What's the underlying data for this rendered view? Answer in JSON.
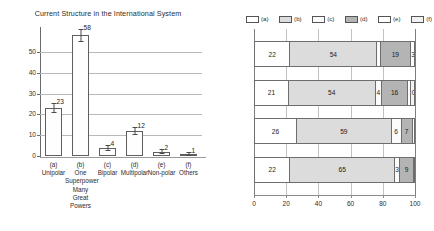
{
  "chart_data": [
    {
      "type": "bar",
      "title": "Current Structure in the International System",
      "xlabel": "",
      "ylabel": "",
      "ylim": [
        0,
        58
      ],
      "yticks": [
        0,
        10,
        20,
        30,
        40,
        50
      ],
      "grid": true,
      "categories": [
        "(a)",
        "(b)",
        "(c)",
        "(d)",
        "(e)",
        "(f)"
      ],
      "category_names": [
        "Unipolar",
        "One Superpower Many Great Powers",
        "Bipolar",
        "Multipolar",
        "Non-polar",
        "Others"
      ],
      "values": [
        23,
        58,
        4,
        12,
        2,
        1
      ],
      "value_labels": [
        "23",
        "58",
        "4",
        "12",
        "2",
        "1"
      ],
      "error_bars": [
        2.5,
        3.0,
        1.5,
        2.0,
        1.2,
        1.0
      ]
    },
    {
      "type": "bar",
      "orientation": "horizontal",
      "stacked": true,
      "title": "",
      "xlabel": "",
      "ylabel": "",
      "xlim": [
        0,
        100
      ],
      "xticks": [
        0,
        20,
        40,
        60,
        80,
        100
      ],
      "xtick_labels": [
        "0",
        "20",
        "40",
        "60",
        "80",
        "100"
      ],
      "categories": [
        "2014",
        "2015",
        "2016",
        "2017"
      ],
      "legend": [
        "(a)",
        "(b)",
        "(c)",
        "(d)",
        "(e)",
        "(f)"
      ],
      "legend_position": "top",
      "series": [
        {
          "name": "(a)",
          "values": [
            22,
            21,
            26,
            22
          ]
        },
        {
          "name": "(b)",
          "values": [
            54,
            54,
            59,
            65
          ]
        },
        {
          "name": "(c)",
          "values": [
            2,
            4,
            6,
            3
          ]
        },
        {
          "name": "(d)",
          "values": [
            19,
            16,
            7,
            9
          ]
        },
        {
          "name": "(e)",
          "values": [
            3,
            2,
            2,
            2
          ]
        },
        {
          "name": "(f)",
          "values": [
            0,
            3,
            0,
            0
          ]
        }
      ],
      "rows": [
        {
          "year": "2014",
          "segments": [
            {
              "key": "(a)",
              "value": 22,
              "label": "22"
            },
            {
              "key": "(b)",
              "value": 54,
              "label": "54"
            },
            {
              "key": "(c)",
              "value": 2,
              "label": "2"
            },
            {
              "key": "(d)",
              "value": 19,
              "label": "19"
            },
            {
              "key": "(e)",
              "value": 3,
              "label": "3"
            },
            {
              "key": "(f)",
              "value": 0,
              "label": ""
            }
          ]
        },
        {
          "year": "2015",
          "segments": [
            {
              "key": "(a)",
              "value": 21,
              "label": "21"
            },
            {
              "key": "(b)",
              "value": 54,
              "label": "54"
            },
            {
              "key": "(c)",
              "value": 4,
              "label": "4"
            },
            {
              "key": "(d)",
              "value": 16,
              "label": "16"
            },
            {
              "key": "(e)",
              "value": 2,
              "label": "2"
            },
            {
              "key": "(f)",
              "value": 3,
              "label": "0"
            }
          ]
        },
        {
          "year": "2016",
          "segments": [
            {
              "key": "(a)",
              "value": 26,
              "label": "26"
            },
            {
              "key": "(b)",
              "value": 59,
              "label": "59"
            },
            {
              "key": "(c)",
              "value": 6,
              "label": "6"
            },
            {
              "key": "(d)",
              "value": 7,
              "label": "7"
            },
            {
              "key": "(e)",
              "value": 2,
              "label": "2"
            },
            {
              "key": "(f)",
              "value": 0,
              "label": ""
            }
          ]
        },
        {
          "year": "2017",
          "segments": [
            {
              "key": "(a)",
              "value": 22,
              "label": "22"
            },
            {
              "key": "(b)",
              "value": 65,
              "label": "65"
            },
            {
              "key": "(c)",
              "value": 3,
              "label": "3"
            },
            {
              "key": "(d)",
              "value": 9,
              "label": "9"
            },
            {
              "key": "(e)",
              "value": 2,
              "label": "2"
            },
            {
              "key": "(f)",
              "value": 0,
              "label": ""
            }
          ]
        }
      ]
    }
  ],
  "colors": {
    "a": "#ffffff",
    "b": "#dcdcdc",
    "c": "#fbfbfb",
    "d": "#b4b4b4",
    "e": "#ffffff",
    "f": "#f2f2f2",
    "axis": "#6a6a6a",
    "grid": "#b9b9b9",
    "text": "#2b2b2b"
  }
}
